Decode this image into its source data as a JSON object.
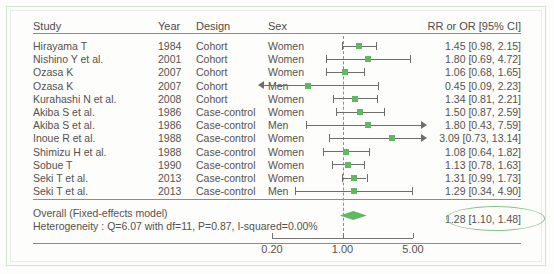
{
  "figure": {
    "headers": {
      "study": "Study",
      "year": "Year",
      "design": "Design",
      "sex": "Sex",
      "effect": "RR or OR [95% CI]"
    },
    "overall_label": "Overall (Fixed-effects model)",
    "heterogeneity": "Heterogeneity : Q=6.07 with df=11, P=0.87, I-squared=0.00%",
    "overall_effect_text": "1.28 [1.10, 1.48]",
    "colors": {
      "marker_green": "#5fb95f",
      "highlight_ellipse": "#86c286",
      "frame": "#cfe3cc",
      "line": "#6f6d6b",
      "text": "#555150"
    }
  },
  "chart_data": {
    "type": "scatter",
    "subtype": "forest-plot",
    "title": "",
    "xlabel": "",
    "ylabel": "",
    "xscale": "log",
    "xlim": [
      0.2,
      5.0
    ],
    "xticks": [
      0.2,
      1.0,
      5.0
    ],
    "xtick_labels": [
      "0.20",
      "1.00",
      "5.00"
    ],
    "null_line": 1.0,
    "grid": false,
    "legend": "none",
    "effect_measure": "RR or OR [95% CI]",
    "model": "Fixed-effects model",
    "columns": [
      "Study",
      "Year",
      "Design",
      "Sex",
      "RR or OR [95% CI]"
    ],
    "rows": [
      {
        "study": "Hirayama T",
        "year": "1984",
        "design": "Cohort",
        "sex": "Women",
        "estimate": 1.45,
        "ci_low": 0.98,
        "ci_high": 2.15,
        "effect_text": "1.45 [0.98, 2.15]",
        "clipped_low": false,
        "clipped_high": false
      },
      {
        "study": "Nishino Y et al.",
        "year": "2001",
        "design": "Cohort",
        "sex": "Women",
        "estimate": 1.8,
        "ci_low": 0.69,
        "ci_high": 4.72,
        "effect_text": "1.80 [0.69, 4.72]",
        "clipped_low": false,
        "clipped_high": false
      },
      {
        "study": "Ozasa K",
        "year": "2007",
        "design": "Cohort",
        "sex": "Women",
        "estimate": 1.06,
        "ci_low": 0.68,
        "ci_high": 1.65,
        "effect_text": "1.06 [0.68, 1.65]",
        "clipped_low": false,
        "clipped_high": false
      },
      {
        "study": "Ozasa K",
        "year": "2007",
        "design": "Cohort",
        "sex": "Men",
        "estimate": 0.45,
        "ci_low": 0.09,
        "ci_high": 2.23,
        "effect_text": "0.45 [0.09, 2.23]",
        "clipped_low": true,
        "clipped_high": false
      },
      {
        "study": "Kurahashi N et al.",
        "year": "2008",
        "design": "Cohort",
        "sex": "Women",
        "estimate": 1.34,
        "ci_low": 0.81,
        "ci_high": 2.21,
        "effect_text": "1.34 [0.81, 2.21]",
        "clipped_low": false,
        "clipped_high": false
      },
      {
        "study": "Akiba S et al.",
        "year": "1986",
        "design": "Case-control",
        "sex": "Women",
        "estimate": 1.5,
        "ci_low": 0.87,
        "ci_high": 2.59,
        "effect_text": "1.50 [0.87, 2.59]",
        "clipped_low": false,
        "clipped_high": false
      },
      {
        "study": "Akiba S et al.",
        "year": "1986",
        "design": "Case-control",
        "sex": "Men",
        "estimate": 1.8,
        "ci_low": 0.43,
        "ci_high": 7.59,
        "effect_text": "1.80 [0.43, 7.59]",
        "clipped_low": false,
        "clipped_high": true
      },
      {
        "study": "Inoue R et al.",
        "year": "1988",
        "design": "Case-control",
        "sex": "Women",
        "estimate": 3.09,
        "ci_low": 0.73,
        "ci_high": 13.14,
        "effect_text": "3.09 [0.73, 13.14]",
        "clipped_low": false,
        "clipped_high": true
      },
      {
        "study": "Shimizu H et al.",
        "year": "1988",
        "design": "Case-control",
        "sex": "Women",
        "estimate": 1.08,
        "ci_low": 0.64,
        "ci_high": 1.82,
        "effect_text": "1.08 [0.64, 1.82]",
        "clipped_low": false,
        "clipped_high": false
      },
      {
        "study": "Sobue T",
        "year": "1990",
        "design": "Case-control",
        "sex": "Women",
        "estimate": 1.13,
        "ci_low": 0.78,
        "ci_high": 1.63,
        "effect_text": "1.13 [0.78, 1.63]",
        "clipped_low": false,
        "clipped_high": false
      },
      {
        "study": "Seki T et al.",
        "year": "2013",
        "design": "Case-control",
        "sex": "Women",
        "estimate": 1.31,
        "ci_low": 0.99,
        "ci_high": 1.73,
        "effect_text": "1.31 [0.99, 1.73]",
        "clipped_low": false,
        "clipped_high": false
      },
      {
        "study": "Seki T et al.",
        "year": "2013",
        "design": "Case-control",
        "sex": "Men",
        "estimate": 1.29,
        "ci_low": 0.34,
        "ci_high": 4.9,
        "effect_text": "1.29 [0.34, 4.90]",
        "clipped_low": false,
        "clipped_high": false
      }
    ],
    "summary": {
      "label": "Overall (Fixed-effects model)",
      "estimate": 1.28,
      "ci_low": 1.1,
      "ci_high": 1.48,
      "effect_text": "1.28 [1.10, 1.48]",
      "heterogeneity": {
        "text": "Heterogeneity : Q=6.07 with df=11, P=0.87, I-squared=0.00%",
        "Q": 6.07,
        "df": 11,
        "P": 0.87,
        "I_squared": "0.00%"
      }
    }
  }
}
